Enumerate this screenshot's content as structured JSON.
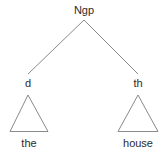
{
  "figure": {
    "type": "syntax-tree",
    "background_color": "#ffffff",
    "line_color": "#8a8a8a",
    "text_color": "#2b2b2b"
  },
  "tree": {
    "root": {
      "label": "Ngp",
      "x": 84,
      "y": 6
    },
    "children": [
      {
        "label": "d",
        "x": 28,
        "y": 78,
        "leaf": {
          "text": "the",
          "x": 29,
          "y": 136
        },
        "triangle": {
          "apex_x": 28,
          "apex_y": 95,
          "left_x": 10,
          "right_x": 48,
          "base_y": 132
        }
      },
      {
        "label": "th",
        "x": 138,
        "y": 78,
        "leaf": {
          "text": "house",
          "x": 138,
          "y": 136
        },
        "triangle": {
          "apex_x": 138,
          "apex_y": 95,
          "left_x": 118,
          "right_x": 158,
          "base_y": 132
        }
      }
    ]
  }
}
